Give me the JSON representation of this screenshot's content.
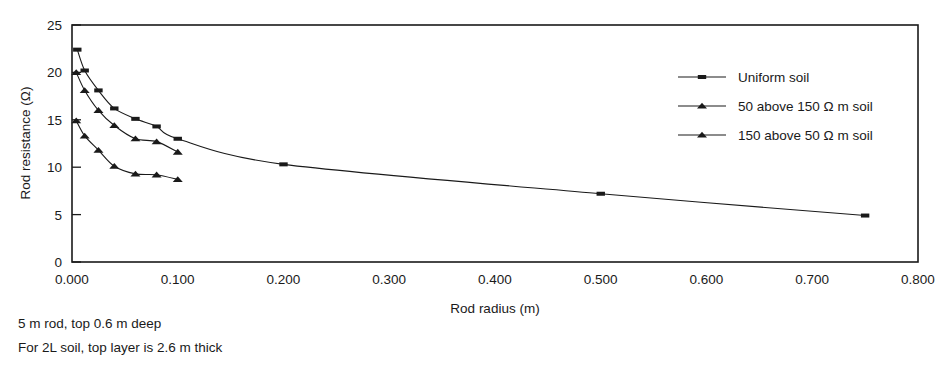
{
  "chart_data": {
    "type": "line",
    "title": "",
    "xlabel": "Rod radius (m)",
    "ylabel": "Rod resistance (Ω)",
    "xlim": [
      0.0,
      0.8
    ],
    "ylim": [
      0,
      25
    ],
    "grid": false,
    "legend_position": "upper-right",
    "xticks": [
      "0.000",
      "0.100",
      "0.200",
      "0.300",
      "0.400",
      "0.500",
      "0.600",
      "0.700",
      "0.800"
    ],
    "xtick_values": [
      0.0,
      0.1,
      0.2,
      0.3,
      0.4,
      0.5,
      0.6,
      0.7,
      0.8
    ],
    "yticks": [
      "0",
      "5",
      "10",
      "15",
      "20",
      "25"
    ],
    "ytick_values": [
      0,
      5,
      10,
      15,
      20,
      25
    ],
    "series": [
      {
        "name": "Uniform soil",
        "marker": "square",
        "x": [
          0.005,
          0.012,
          0.025,
          0.04,
          0.06,
          0.08,
          0.1,
          0.2,
          0.5,
          0.75
        ],
        "values": [
          22.4,
          20.2,
          18.1,
          16.2,
          15.1,
          14.3,
          13.0,
          10.3,
          7.2,
          4.9
        ]
      },
      {
        "name": "50 above 150 Ω m soil",
        "marker": "triangle",
        "x": [
          0.004,
          0.012,
          0.025,
          0.04,
          0.06,
          0.08,
          0.1
        ],
        "values": [
          20.0,
          18.1,
          16.0,
          14.4,
          13.0,
          12.7,
          11.6
        ]
      },
      {
        "name": "150 above 50 Ω m soil",
        "marker": "triangle",
        "x": [
          0.004,
          0.012,
          0.025,
          0.04,
          0.06,
          0.08,
          0.1
        ],
        "values": [
          14.9,
          13.3,
          11.8,
          10.1,
          9.3,
          9.2,
          8.7
        ]
      }
    ]
  },
  "legend": {
    "items": [
      {
        "label": "Uniform soil"
      },
      {
        "label": "50 above 150 Ω m soil"
      },
      {
        "label": "150 above 50 Ω m soil"
      }
    ]
  },
  "caption": {
    "line1": "5 m rod, top 0.6 m deep",
    "line2": "For 2L soil, top layer is 2.6 m thick"
  }
}
